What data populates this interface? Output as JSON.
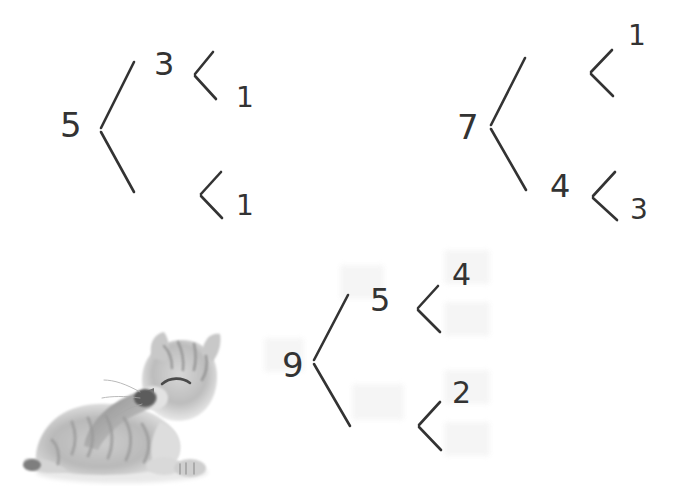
{
  "page": {
    "background_color": "#ffffff",
    "ink_color": "#333333",
    "width": 688,
    "height": 497
  },
  "bonds": [
    {
      "id": "bond-left",
      "root": "5",
      "root_pos": {
        "x": 60,
        "y": 108
      },
      "root_size": 34,
      "children": [
        {
          "id": "bond-left-upper",
          "value": "3",
          "pos": {
            "x": 154,
            "y": 48
          },
          "size": 32,
          "children": [
            {
              "id": "bond-left-upper-a",
              "value": "1",
              "pos": {
                "x": 236,
                "y": 84
              },
              "size": 28
            },
            {
              "id": "bond-left-upper-b",
              "value": "",
              "pos": {
                "x": 236,
                "y": 18
              },
              "size": 28
            }
          ]
        },
        {
          "id": "bond-left-lower",
          "value": "",
          "pos": {
            "x": 154,
            "y": 168
          },
          "size": 32,
          "children": [
            {
              "id": "bond-left-lower-a",
              "value": "1",
              "pos": {
                "x": 236,
                "y": 192
              },
              "size": 28
            },
            {
              "id": "bond-left-lower-b",
              "value": "",
              "pos": {
                "x": 236,
                "y": 136
              },
              "size": 28
            }
          ]
        }
      ]
    },
    {
      "id": "bond-right",
      "root": "7",
      "root_pos": {
        "x": 457,
        "y": 110
      },
      "root_size": 34,
      "children": [
        {
          "id": "bond-right-upper",
          "value": "",
          "pos": {
            "x": 548,
            "y": 46
          },
          "size": 32,
          "children": [
            {
              "id": "bond-right-upper-a",
              "value": "1",
              "pos": {
                "x": 628,
                "y": 22
              },
              "size": 28
            },
            {
              "id": "bond-right-upper-b",
              "value": "",
              "pos": {
                "x": 628,
                "y": 84
              },
              "size": 28
            }
          ]
        },
        {
          "id": "bond-right-lower",
          "value": "4",
          "pos": {
            "x": 550,
            "y": 170
          },
          "size": 32,
          "children": [
            {
              "id": "bond-right-lower-a",
              "value": "",
              "pos": {
                "x": 630,
                "y": 146
              },
              "size": 28
            },
            {
              "id": "bond-right-lower-b",
              "value": "3",
              "pos": {
                "x": 630,
                "y": 196
              },
              "size": 28
            }
          ]
        }
      ]
    },
    {
      "id": "bond-bottom",
      "root": "9",
      "root_pos": {
        "x": 282,
        "y": 348
      },
      "root_size": 34,
      "children": [
        {
          "id": "bond-bottom-upper",
          "value": "5",
          "pos": {
            "x": 370,
            "y": 284
          },
          "size": 32,
          "children": [
            {
              "id": "bond-bottom-upper-a",
              "value": "4",
              "pos": {
                "x": 452,
                "y": 260
              },
              "size": 30
            },
            {
              "id": "bond-bottom-upper-b",
              "value": "",
              "pos": {
                "x": 452,
                "y": 320
              },
              "size": 30
            }
          ]
        },
        {
          "id": "bond-bottom-lower",
          "value": "",
          "pos": {
            "x": 370,
            "y": 404
          },
          "size": 32,
          "children": [
            {
              "id": "bond-bottom-lower-a",
              "value": "2",
              "pos": {
                "x": 452,
                "y": 378
              },
              "size": 30
            },
            {
              "id": "bond-bottom-lower-b",
              "value": "",
              "pos": {
                "x": 452,
                "y": 438
              },
              "size": 30
            }
          ]
        }
      ]
    }
  ],
  "image": {
    "id": "kitten-photo",
    "alt": "Grayscale photo of a tabby kitten lying down grooming its paw"
  }
}
